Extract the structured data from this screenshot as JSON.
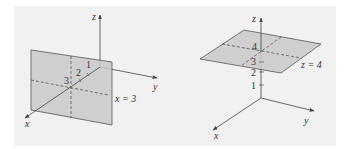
{
  "colors": {
    "background": "#f1f1f1",
    "plane_fill": "#c9c9c9",
    "line": "#444444"
  },
  "left_diagram": {
    "axes": {
      "x": "x",
      "y": "y",
      "z": "z"
    },
    "ticks": [
      "1",
      "2",
      "3"
    ],
    "plane_label": "x = 3"
  },
  "right_diagram": {
    "axes": {
      "x": "x",
      "y": "y",
      "z": "z"
    },
    "ticks": [
      "1",
      "2",
      "3",
      "4"
    ],
    "plane_label": "z = 4"
  }
}
